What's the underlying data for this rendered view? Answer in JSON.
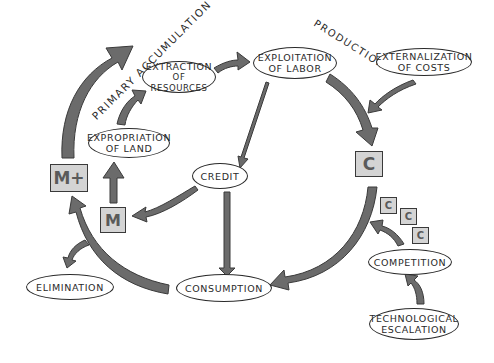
{
  "diagram": {
    "type": "hand-drawn cycle diagram",
    "colors": {
      "arrow": "#6b6b6b",
      "box_fill": "#d4d4d4",
      "outline": "#2a2a2a",
      "background": "#ffffff"
    },
    "section_labels": {
      "primary_accumulation": "PRIMARY ACCUMULATION",
      "production": "PRODUCTION"
    },
    "nodes": {
      "extraction": {
        "line1": "EXTRACTION",
        "line2": "OF RESOURCES"
      },
      "expropriation": {
        "line1": "EXPROPRIATION",
        "line2": "OF LAND"
      },
      "exploitation": {
        "line1": "EXPLOITATION",
        "line2": "OF LABOR"
      },
      "externalization": {
        "line1": "EXTERNALIZATION",
        "line2": "OF COSTS"
      },
      "credit": {
        "line1": "CREDIT"
      },
      "elimination": {
        "line1": "ELIMINATION"
      },
      "consumption": {
        "line1": "CONSUMPTION"
      },
      "competition": {
        "line1": "COMPETITION"
      },
      "technological": {
        "line1": "TECHNOLOGICAL",
        "line2": "ESCALATION"
      }
    },
    "boxes": {
      "m_plus": "M+",
      "m": "M",
      "c_main": "C",
      "c_small_1": "C",
      "c_small_2": "C",
      "c_small_3": "C"
    }
  }
}
